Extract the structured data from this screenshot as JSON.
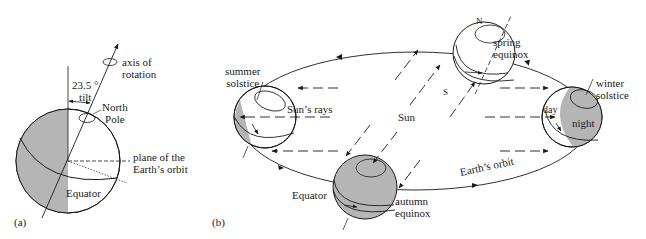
{
  "figure": {
    "panel_a": {
      "tag": "(a)",
      "labels": {
        "axis": "axis of\nrotation",
        "axis_l1": "axis of",
        "axis_l2": "rotation",
        "tilt_l1": "23.5 °",
        "tilt_l2": "tilt",
        "pole_l1": "North",
        "pole_l2": "Pole",
        "plane_l1": "plane of the",
        "plane_l2": "Earth’s orbit",
        "equator": "Equator"
      }
    },
    "panel_b": {
      "tag": "(b)",
      "labels": {
        "summer_l1": "summer",
        "summer_l2": "solstice",
        "sun_rays": "Sun’s rays",
        "sun": "Sun",
        "spring_l1": "spring",
        "spring_l2": "equinox",
        "north": "N",
        "south": "S",
        "winter_l1": "winter",
        "winter_l2": "solstice",
        "day": "day",
        "night": "night",
        "orbit": "Earth’s orbit",
        "equator": "Equator",
        "autumn_l1": "autumn",
        "autumn_l2": "equinox"
      }
    },
    "colors": {
      "shade": "#b5b5b5",
      "line": "#1a1a1a"
    }
  }
}
